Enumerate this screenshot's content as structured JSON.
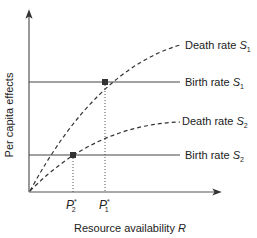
{
  "diagram": {
    "y_axis_label": "Per capita effects",
    "x_axis_label": "Resource availability",
    "x_axis_var": "R",
    "curves": [
      {
        "id": "death_s1",
        "label": "Death rate",
        "sub": "1",
        "style": "dashed",
        "type": "saturating curve"
      },
      {
        "id": "birth_s1",
        "label": "Birth rate",
        "sub": "1",
        "style": "solid",
        "type": "horizontal line"
      },
      {
        "id": "death_s2",
        "label": "Death rate",
        "sub": "2",
        "style": "dashed",
        "type": "saturating curve"
      },
      {
        "id": "birth_s2",
        "label": "Birth rate",
        "sub": "2",
        "style": "solid",
        "type": "horizontal line"
      }
    ],
    "species_var": "S",
    "equilibria": [
      {
        "label": "P",
        "sub": "2",
        "sup": "*"
      },
      {
        "label": "P",
        "sub": "1",
        "sup": "*"
      }
    ],
    "colors": {
      "line": "#333333",
      "marker": "#333333"
    }
  }
}
